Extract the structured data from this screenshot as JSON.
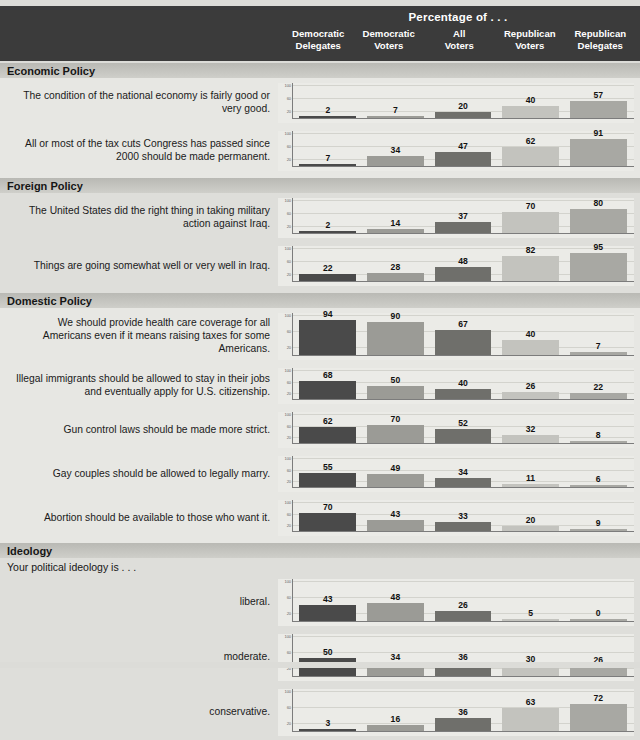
{
  "header": {
    "title": "Percentage of . . .",
    "columns": [
      {
        "line1": "Democratic",
        "line2": "Delegates"
      },
      {
        "line1": "Democratic",
        "line2": "Voters"
      },
      {
        "line1": "All",
        "line2": "Voters"
      },
      {
        "line1": "Republican",
        "line2": "Voters"
      },
      {
        "line1": "Republican",
        "line2": "Delegates"
      }
    ]
  },
  "axis": {
    "ticks": [
      "100",
      "60",
      "20"
    ],
    "ymax": 100
  },
  "colors": {
    "series": [
      "#4a4a4a",
      "#9b9b96",
      "#6f6f6b",
      "#c3c3be",
      "#a8a8a3"
    ],
    "header_band": "#3b3b3b",
    "section_band": "#bdbdb8",
    "plot_bg": "#ebebe7"
  },
  "sections": [
    {
      "title": "Economic Policy",
      "subtitle": "",
      "rows": [
        {
          "label": "The condition of the national economy is fairly good or very good.",
          "values": [
            2,
            7,
            20,
            40,
            57
          ]
        },
        {
          "label": "All or most of the tax cuts Congress has passed since 2000 should be made permanent.",
          "values": [
            7,
            34,
            47,
            62,
            91
          ]
        }
      ]
    },
    {
      "title": "Foreign Policy",
      "subtitle": "",
      "rows": [
        {
          "label": "The United States did the right thing in taking military action against Iraq.",
          "values": [
            2,
            14,
            37,
            70,
            80
          ]
        },
        {
          "label": "Things are going somewhat well or very well in Iraq.",
          "values": [
            22,
            28,
            48,
            82,
            95
          ]
        }
      ]
    },
    {
      "title": "Domestic Policy",
      "subtitle": "",
      "rows": [
        {
          "label": "We should provide health care coverage for all Americans even if it means raising taxes for some Americans.",
          "values": [
            94,
            90,
            67,
            40,
            7
          ]
        },
        {
          "label": "Illegal immigrants should be allowed to stay in their jobs and eventually apply for U.S. citizenship.",
          "values": [
            68,
            50,
            40,
            26,
            22
          ]
        },
        {
          "label": "Gun control laws should be made more strict.",
          "values": [
            62,
            70,
            52,
            32,
            8
          ]
        },
        {
          "label": "Gay couples should be allowed to legally marry.",
          "values": [
            55,
            49,
            34,
            11,
            6
          ]
        },
        {
          "label": "Abortion should be available to those who want it.",
          "values": [
            70,
            43,
            33,
            20,
            9
          ]
        }
      ]
    },
    {
      "title": "Ideology",
      "subtitle": "Your political ideology is . . .",
      "rows": [
        {
          "label": "liberal.",
          "values": [
            43,
            48,
            26,
            5,
            0
          ]
        },
        {
          "label": "moderate.",
          "values": [
            50,
            34,
            36,
            30,
            26
          ]
        },
        {
          "label": "conservative.",
          "values": [
            3,
            16,
            36,
            63,
            72
          ]
        }
      ]
    }
  ],
  "chart_data": {
    "type": "bar",
    "title": "Percentage of . . .",
    "xlabel": "",
    "ylabel": "Percentage",
    "ylim": [
      0,
      100
    ],
    "grid": true,
    "legend_position": "top",
    "categories": [
      "Democratic Delegates",
      "Democratic Voters",
      "All Voters",
      "Republican Voters",
      "Republican Delegates"
    ],
    "panels": [
      {
        "section": "Economic Policy",
        "question": "The condition of the national economy is fairly good or very good.",
        "values": [
          2,
          7,
          20,
          40,
          57
        ]
      },
      {
        "section": "Economic Policy",
        "question": "All or most of the tax cuts Congress has passed since 2000 should be made permanent.",
        "values": [
          7,
          34,
          47,
          62,
          91
        ]
      },
      {
        "section": "Foreign Policy",
        "question": "The United States did the right thing in taking military action against Iraq.",
        "values": [
          2,
          14,
          37,
          70,
          80
        ]
      },
      {
        "section": "Foreign Policy",
        "question": "Things are going somewhat well or very well in Iraq.",
        "values": [
          22,
          28,
          48,
          82,
          95
        ]
      },
      {
        "section": "Domestic Policy",
        "question": "We should provide health care coverage for all Americans even if it means raising taxes for some Americans.",
        "values": [
          94,
          90,
          67,
          40,
          7
        ]
      },
      {
        "section": "Domestic Policy",
        "question": "Illegal immigrants should be allowed to stay in their jobs and eventually apply for U.S. citizenship.",
        "values": [
          68,
          50,
          40,
          26,
          22
        ]
      },
      {
        "section": "Domestic Policy",
        "question": "Gun control laws should be made more strict.",
        "values": [
          62,
          70,
          52,
          32,
          8
        ]
      },
      {
        "section": "Domestic Policy",
        "question": "Gay couples should be allowed to legally marry.",
        "values": [
          55,
          49,
          34,
          11,
          6
        ]
      },
      {
        "section": "Domestic Policy",
        "question": "Abortion should be available to those who want it.",
        "values": [
          70,
          43,
          33,
          20,
          9
        ]
      },
      {
        "section": "Ideology",
        "question": "Your political ideology is . . . liberal.",
        "values": [
          43,
          48,
          26,
          5,
          0
        ]
      },
      {
        "section": "Ideology",
        "question": "Your political ideology is . . . moderate.",
        "values": [
          50,
          34,
          36,
          30,
          26
        ]
      },
      {
        "section": "Ideology",
        "question": "Your political ideology is . . . conservative.",
        "values": [
          3,
          16,
          36,
          63,
          72
        ]
      }
    ],
    "yticks": [
      20,
      60,
      100
    ]
  }
}
